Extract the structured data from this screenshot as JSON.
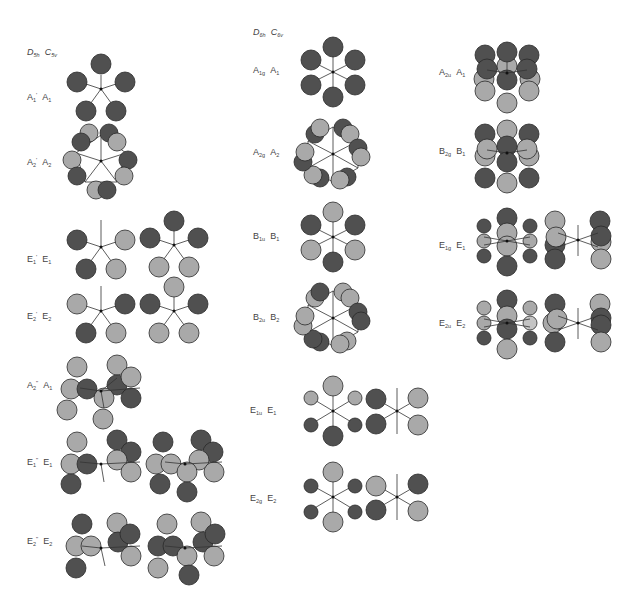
{
  "colors": {
    "dark": "#505050",
    "light": "#a9a9a9",
    "stroke": "#2a2a2a",
    "bond": "#333333"
  },
  "column_headers": [
    {
      "point_group_high": "D",
      "high_sub": "5h",
      "point_group_low": "C",
      "low_sub": "5v"
    },
    {
      "point_group_high": "D",
      "high_sub": "6h",
      "point_group_low": "C",
      "low_sub": "6v"
    }
  ],
  "d5h_column": [
    {
      "high": "A",
      "high_sub": "1",
      "high_sup": "'",
      "low": "A",
      "low_sub": "1"
    },
    {
      "high": "A",
      "high_sub": "2",
      "high_sup": "'",
      "low": "A",
      "low_sub": "2"
    },
    {
      "high": "E",
      "high_sub": "1",
      "high_sup": "'",
      "low": "E",
      "low_sub": "1"
    },
    {
      "high": "E",
      "high_sub": "2",
      "high_sup": "'",
      "low": "E",
      "low_sub": "2"
    },
    {
      "high": "A",
      "high_sub": "2",
      "high_sup": "\"",
      "low": "A",
      "low_sub": "1"
    },
    {
      "high": "E",
      "high_sub": "1",
      "high_sup": "\"",
      "low": "E",
      "low_sub": "1"
    },
    {
      "high": "E",
      "high_sub": "2",
      "high_sup": "\"",
      "low": "E",
      "low_sub": "2"
    }
  ],
  "d6h_column_middle": [
    {
      "high": "A",
      "high_sub": "1g",
      "low": "A",
      "low_sub": "1"
    },
    {
      "high": "A",
      "high_sub": "2g",
      "low": "A",
      "low_sub": "2"
    },
    {
      "high": "B",
      "high_sub": "1u",
      "low": "B",
      "low_sub": "1"
    },
    {
      "high": "B",
      "high_sub": "2u",
      "low": "B",
      "low_sub": "2"
    },
    {
      "high": "E",
      "high_sub": "1u",
      "low": "E",
      "low_sub": "1"
    },
    {
      "high": "E",
      "high_sub": "2g",
      "low": "E",
      "low_sub": "2"
    }
  ],
  "d6h_column_right": [
    {
      "high": "A",
      "high_sub": "2u",
      "low": "A",
      "low_sub": "1"
    },
    {
      "high": "B",
      "high_sub": "2g",
      "low": "B",
      "low_sub": "1"
    },
    {
      "high": "E",
      "high_sub": "1g",
      "low": "E",
      "low_sub": "1"
    },
    {
      "high": "E",
      "high_sub": "2u",
      "low": "E",
      "low_sub": "2"
    }
  ]
}
